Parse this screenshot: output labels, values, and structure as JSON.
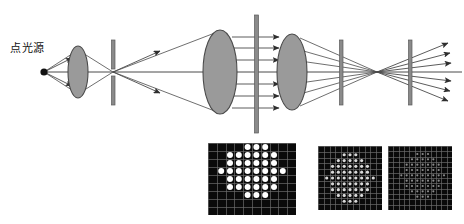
{
  "figure": {
    "title": "",
    "background_color": "#ffffff",
    "stroke_color": "#3d3d3d",
    "lens_fill": "#9a9a9a",
    "lens_stroke": "#4a4a4a",
    "barrier_color": "#8a8a8a",
    "barrier_stroke": "#5a5a5a",
    "panel_background": "#0a0a0a",
    "panel_grid_color": "#6e6e6e",
    "dot_color": "#ffffff"
  },
  "labels": {
    "point_source": "点光源"
  },
  "components": [
    {
      "name": "point-source",
      "type": "source",
      "x": 44,
      "y": 72,
      "label": "点光源"
    },
    {
      "name": "collimator-lens-small",
      "type": "lens",
      "cx": 78,
      "cy": 72,
      "rx": 10,
      "ry": 26
    },
    {
      "name": "pinhole-aperture",
      "type": "barrier",
      "x": 113,
      "y_top": 40,
      "y_bottom": 105
    },
    {
      "name": "collimating-lens-large",
      "type": "lens",
      "cx": 220,
      "cy": 72,
      "rx": 17,
      "ry": 42
    },
    {
      "name": "grating-plate",
      "type": "barrier",
      "x": 256,
      "y_top": 15,
      "y_bottom": 133
    },
    {
      "name": "focusing-lens",
      "type": "lens",
      "cx": 292,
      "cy": 72,
      "rx": 15,
      "ry": 38
    },
    {
      "name": "stop-aperture",
      "type": "barrier",
      "x": 341,
      "y_top": 40,
      "y_bottom": 105
    },
    {
      "name": "output-aperture",
      "type": "barrier",
      "x": 410,
      "y_top": 40,
      "y_bottom": 105
    },
    {
      "name": "focal-point",
      "type": "crossing",
      "x": 377,
      "y": 72
    }
  ],
  "ray_counts": {
    "source_rays": 2,
    "collimated_beam_rays": 6,
    "converging_rays": 6,
    "output_rays": 6
  },
  "panels": [
    {
      "name": "spot-array-panel-near",
      "caption": "",
      "x": 208,
      "y": 143,
      "width": 88,
      "height": 72,
      "grid_cols": 10,
      "grid_rows": 9,
      "dot_radius": 3.0,
      "brightness": 1.0,
      "dots": [
        [
          4,
          0
        ],
        [
          5,
          0
        ],
        [
          6,
          0
        ],
        [
          2,
          1
        ],
        [
          3,
          1
        ],
        [
          4,
          1
        ],
        [
          5,
          1
        ],
        [
          6,
          1
        ],
        [
          7,
          1
        ],
        [
          2,
          2
        ],
        [
          3,
          2
        ],
        [
          4,
          2
        ],
        [
          5,
          2
        ],
        [
          6,
          2
        ],
        [
          7,
          2
        ],
        [
          1,
          3
        ],
        [
          2,
          3
        ],
        [
          3,
          3
        ],
        [
          4,
          3
        ],
        [
          5,
          3
        ],
        [
          6,
          3
        ],
        [
          7,
          3
        ],
        [
          8,
          3
        ],
        [
          2,
          4
        ],
        [
          3,
          4
        ],
        [
          4,
          4
        ],
        [
          5,
          4
        ],
        [
          6,
          4
        ],
        [
          7,
          4
        ],
        [
          2,
          5
        ],
        [
          3,
          5
        ],
        [
          4,
          5
        ],
        [
          5,
          5
        ],
        [
          6,
          5
        ],
        [
          7,
          5
        ],
        [
          4,
          6
        ],
        [
          5,
          6
        ],
        [
          6,
          6
        ]
      ]
    },
    {
      "name": "spot-array-panel-mid",
      "caption": "",
      "x": 318,
      "y": 146,
      "width": 64,
      "height": 64,
      "grid_cols": 11,
      "grid_rows": 11,
      "dot_radius": 1.6,
      "brightness": 0.85,
      "dots": [
        [
          4,
          1
        ],
        [
          5,
          1
        ],
        [
          6,
          1
        ],
        [
          3,
          2
        ],
        [
          4,
          2
        ],
        [
          5,
          2
        ],
        [
          6,
          2
        ],
        [
          7,
          2
        ],
        [
          2,
          3
        ],
        [
          3,
          3
        ],
        [
          4,
          3
        ],
        [
          5,
          3
        ],
        [
          6,
          3
        ],
        [
          7,
          3
        ],
        [
          8,
          3
        ],
        [
          2,
          4
        ],
        [
          3,
          4
        ],
        [
          4,
          4
        ],
        [
          5,
          4
        ],
        [
          6,
          4
        ],
        [
          7,
          4
        ],
        [
          8,
          4
        ],
        [
          1,
          5
        ],
        [
          2,
          5
        ],
        [
          3,
          5
        ],
        [
          4,
          5
        ],
        [
          5,
          5
        ],
        [
          6,
          5
        ],
        [
          7,
          5
        ],
        [
          8,
          5
        ],
        [
          9,
          5
        ],
        [
          2,
          6
        ],
        [
          3,
          6
        ],
        [
          4,
          6
        ],
        [
          5,
          6
        ],
        [
          6,
          6
        ],
        [
          7,
          6
        ],
        [
          8,
          6
        ],
        [
          2,
          7
        ],
        [
          3,
          7
        ],
        [
          4,
          7
        ],
        [
          5,
          7
        ],
        [
          6,
          7
        ],
        [
          7,
          7
        ],
        [
          8,
          7
        ],
        [
          3,
          8
        ],
        [
          4,
          8
        ],
        [
          5,
          8
        ],
        [
          6,
          8
        ],
        [
          7,
          8
        ],
        [
          4,
          9
        ],
        [
          5,
          9
        ],
        [
          6,
          9
        ]
      ]
    },
    {
      "name": "spot-array-panel-far",
      "caption": "",
      "x": 388,
      "y": 146,
      "width": 64,
      "height": 64,
      "grid_cols": 12,
      "grid_rows": 12,
      "dot_radius": 1.1,
      "brightness": 0.55,
      "dots": [
        [
          5,
          1
        ],
        [
          6,
          1
        ],
        [
          7,
          1
        ],
        [
          4,
          2
        ],
        [
          5,
          2
        ],
        [
          6,
          2
        ],
        [
          7,
          2
        ],
        [
          8,
          2
        ],
        [
          3,
          3
        ],
        [
          4,
          3
        ],
        [
          5,
          3
        ],
        [
          6,
          3
        ],
        [
          7,
          3
        ],
        [
          8,
          3
        ],
        [
          9,
          3
        ],
        [
          3,
          4
        ],
        [
          4,
          4
        ],
        [
          5,
          4
        ],
        [
          6,
          4
        ],
        [
          7,
          4
        ],
        [
          8,
          4
        ],
        [
          9,
          4
        ],
        [
          2,
          5
        ],
        [
          3,
          5
        ],
        [
          4,
          5
        ],
        [
          5,
          5
        ],
        [
          6,
          5
        ],
        [
          7,
          5
        ],
        [
          8,
          5
        ],
        [
          9,
          5
        ],
        [
          10,
          5
        ],
        [
          3,
          6
        ],
        [
          4,
          6
        ],
        [
          5,
          6
        ],
        [
          6,
          6
        ],
        [
          7,
          6
        ],
        [
          8,
          6
        ],
        [
          9,
          6
        ],
        [
          3,
          7
        ],
        [
          4,
          7
        ],
        [
          5,
          7
        ],
        [
          6,
          7
        ],
        [
          7,
          7
        ],
        [
          8,
          7
        ],
        [
          9,
          7
        ],
        [
          4,
          8
        ],
        [
          5,
          8
        ],
        [
          6,
          8
        ],
        [
          7,
          8
        ],
        [
          8,
          8
        ],
        [
          5,
          9
        ],
        [
          6,
          9
        ],
        [
          7,
          9
        ]
      ]
    }
  ]
}
